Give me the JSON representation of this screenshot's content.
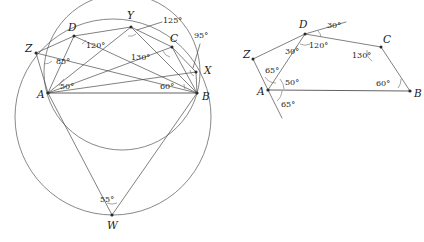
{
  "figure": {
    "caption_fragment": "",
    "background": "#ffffff",
    "line_color": "#4a4a4a",
    "label_color": "#1a1a1a",
    "width": 424,
    "height": 242
  },
  "left_diagram": {
    "name": "circumscribed-quadrilateral-with-circles",
    "points": [
      {
        "label": "Z",
        "x": 36,
        "y": 53,
        "lx": 25,
        "ly": 52
      },
      {
        "label": "D",
        "x": 74,
        "y": 36,
        "lx": 68,
        "ly": 31
      },
      {
        "label": "Y",
        "x": 131,
        "y": 27,
        "lx": 127,
        "ly": 19
      },
      {
        "label": "C",
        "x": 172,
        "y": 47,
        "lx": 170,
        "ly": 42
      },
      {
        "label": "X",
        "x": 196,
        "y": 72,
        "lx": 204,
        "ly": 74
      },
      {
        "label": "A",
        "x": 48,
        "y": 93,
        "lx": 37,
        "ly": 98
      },
      {
        "label": "B",
        "x": 197,
        "y": 93,
        "lx": 202,
        "ly": 100
      },
      {
        "label": "W",
        "x": 112,
        "y": 215,
        "lx": 107,
        "ly": 229
      }
    ],
    "angles": [
      {
        "value": "85°",
        "x": 56,
        "y": 64,
        "anchor": "start"
      },
      {
        "value": "120°",
        "x": 86,
        "y": 48,
        "anchor": "start"
      },
      {
        "value": "125°",
        "x": 163,
        "y": 23,
        "anchor": "start"
      },
      {
        "value": "130°",
        "x": 131,
        "y": 60,
        "anchor": "start"
      },
      {
        "value": "95°",
        "x": 194,
        "y": 38,
        "anchor": "start"
      },
      {
        "value": "50°",
        "x": 60,
        "y": 89,
        "anchor": "start"
      },
      {
        "value": "60°",
        "x": 160,
        "y": 89,
        "anchor": "start"
      },
      {
        "value": "55°",
        "x": 100,
        "y": 202,
        "anchor": "start"
      }
    ],
    "circles": [
      {
        "name": "outer-circle",
        "cx": 113,
        "cy": 117,
        "r": 98
      },
      {
        "name": "inner-circle",
        "cx": 122,
        "cy": 72,
        "r": 78
      }
    ]
  },
  "right_diagram": {
    "name": "quadrilateral-angle-breakdown",
    "points": [
      {
        "label": "Z",
        "x": 253,
        "y": 59,
        "lx": 243,
        "ly": 58
      },
      {
        "label": "D",
        "x": 305,
        "y": 34,
        "lx": 299,
        "ly": 28
      },
      {
        "label": "C",
        "x": 381,
        "y": 47,
        "lx": 383,
        "ly": 43
      },
      {
        "label": "A",
        "x": 268,
        "y": 90,
        "lx": 257,
        "ly": 95
      },
      {
        "label": "B",
        "x": 410,
        "y": 91,
        "lx": 414,
        "ly": 97
      }
    ],
    "angles": [
      {
        "value": "30°",
        "x": 285,
        "y": 54,
        "anchor": "start"
      },
      {
        "value": "30°",
        "x": 327,
        "y": 28,
        "anchor": "start"
      },
      {
        "value": "120°",
        "x": 309,
        "y": 48,
        "anchor": "start"
      },
      {
        "value": "130°",
        "x": 352,
        "y": 58,
        "anchor": "start"
      },
      {
        "value": "65°",
        "x": 265,
        "y": 73,
        "anchor": "start"
      },
      {
        "value": "50°",
        "x": 285,
        "y": 85,
        "anchor": "start"
      },
      {
        "value": "65°",
        "x": 281,
        "y": 107,
        "anchor": "start"
      },
      {
        "value": "60°",
        "x": 376,
        "y": 86,
        "anchor": "start"
      }
    ]
  }
}
